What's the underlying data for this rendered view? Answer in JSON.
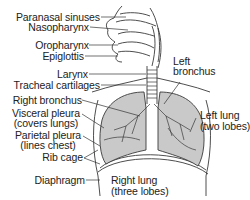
{
  "diagram": {
    "colors": {
      "lung_fill": "#c9c9c9",
      "line": "#3a3a3a",
      "text": "#222222",
      "background": "#ffffff"
    },
    "labels": {
      "paranasal_sinuses": "Paranasal sinuses",
      "nasopharynx": "Nasopharynx",
      "oropharynx": "Oropharynx",
      "epiglottis": "Epiglottis",
      "larynx": "Larynx",
      "tracheal_cartilages": "Tracheal cartilages",
      "right_bronchus": "Right bronchus",
      "visceral_pleura_1": "Visceral pleura",
      "visceral_pleura_2": "(covers lungs)",
      "parietal_pleura_1": "Parietal pleura",
      "parietal_pleura_2": "(lines chest)",
      "rib_cage": "Rib cage",
      "diaphragm": "Diaphragm",
      "left_bronchus_1": "Left",
      "left_bronchus_2": "bronchus",
      "left_lung_1": "Left lung",
      "left_lung_2": "(two lobes)",
      "right_lung_1": "Right lung",
      "right_lung_2": "(three lobes)"
    }
  }
}
